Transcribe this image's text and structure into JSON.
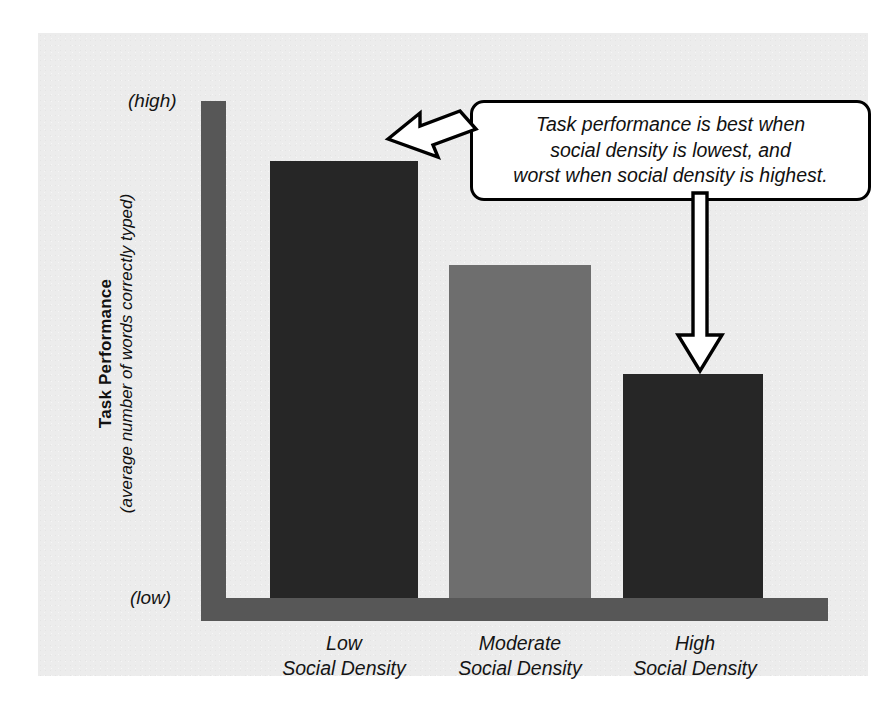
{
  "figure": {
    "background_color": "#ececec",
    "page_color": "#ffffff"
  },
  "axes": {
    "y_title_main": "Task Performance",
    "y_title_sub": "(average number of words correctly typed)",
    "y_high_label": "(high)",
    "y_low_label": "(low)",
    "axis_color": "#575757"
  },
  "annotation": {
    "callout_text": "Task performance is best when\nsocial density is lowest, and\nworst when social density is highest.",
    "arrow_left_name": "arrow-pointing-to-low-bar",
    "arrow_down_name": "arrow-pointing-to-high-bar",
    "border_color": "#000000",
    "fill_color": "#ffffff"
  },
  "chart_data": {
    "type": "bar",
    "title": "",
    "xlabel": "",
    "ylabel": "Task Performance (average number of words correctly typed)",
    "categories": [
      "Low\nSocial Density",
      "Moderate\nSocial Density",
      "High\nSocial Density"
    ],
    "category_lines": [
      {
        "line1": "Low",
        "line2": "Social Density"
      },
      {
        "line1": "Moderate",
        "line2": "Social Density"
      },
      {
        "line1": "High",
        "line2": "Social Density"
      }
    ],
    "values": [
      88,
      67,
      45
    ],
    "ylim": [
      0,
      100
    ],
    "ytick_labels": [
      "(low)",
      "(high)"
    ],
    "grid": false,
    "legend": false,
    "bar_colors": [
      "#262626",
      "#6e6e6e",
      "#262626"
    ],
    "annotations": [
      "Task performance is best when social density is lowest, and worst when social density is highest."
    ]
  }
}
